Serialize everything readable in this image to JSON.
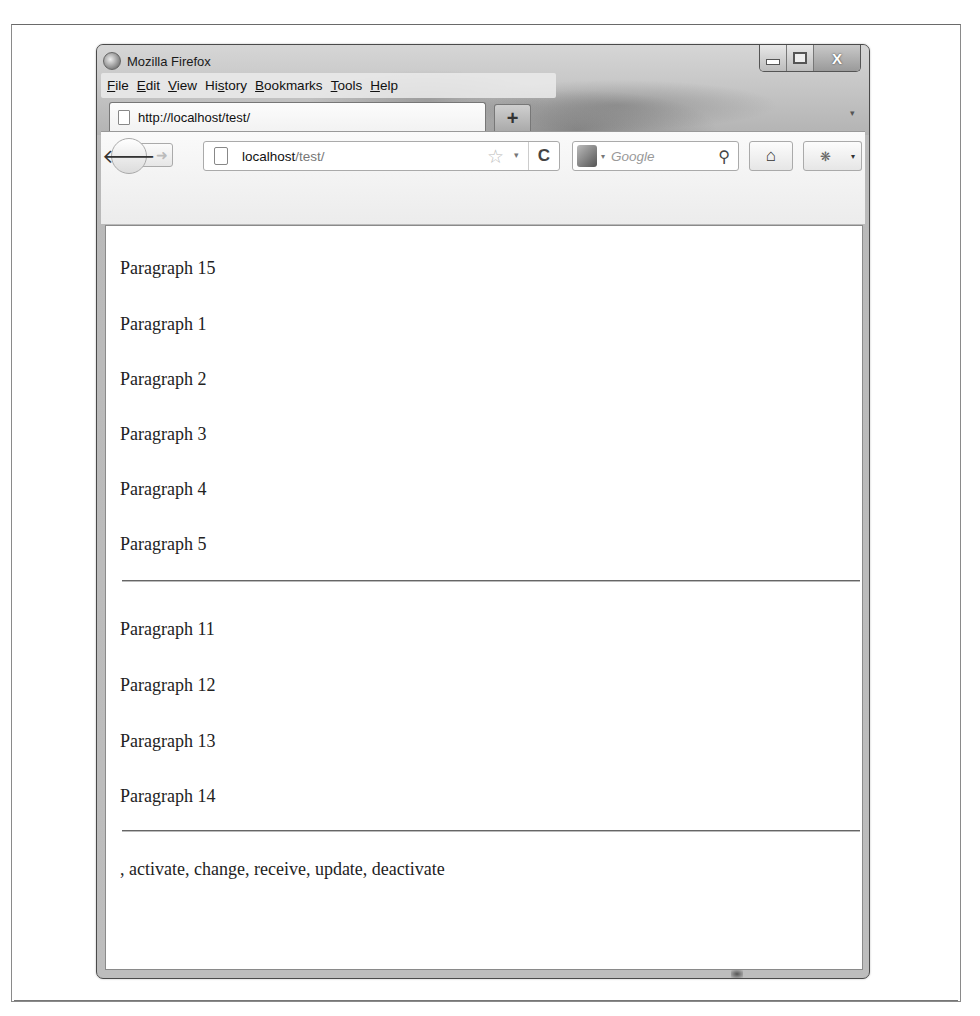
{
  "window": {
    "title": "Mozilla Firefox",
    "controls": {
      "minimize": "minimize",
      "maximize": "maximize",
      "close": "X"
    }
  },
  "menu_bar": {
    "items": [
      {
        "label": "File",
        "accesskey": "F",
        "rest": "ile"
      },
      {
        "label": "Edit",
        "accesskey": "E",
        "rest": "dit"
      },
      {
        "label": "View",
        "accesskey": "V",
        "rest": "iew"
      },
      {
        "label": "History",
        "pre": "Hi",
        "accesskey": "s",
        "rest": "tory"
      },
      {
        "label": "Bookmarks",
        "accesskey": "B",
        "rest": "ookmarks"
      },
      {
        "label": "Tools",
        "accesskey": "T",
        "rest": "ools"
      },
      {
        "label": "Help",
        "accesskey": "H",
        "rest": "elp"
      }
    ]
  },
  "tabs": [
    {
      "label": "http://localhost/test/",
      "active": true
    }
  ],
  "tab_strip": {
    "new_tab": "+",
    "tab_list_arrow": "▾"
  },
  "toolbar": {
    "back": "🡐",
    "forward": "➜",
    "url": {
      "host": "localhost",
      "path": "/test/"
    },
    "bookmark_star": "☆",
    "url_dropdown": "▾",
    "reload": "C",
    "search": {
      "engine_dropdown": "▾",
      "placeholder": "Google",
      "icon": "⚲"
    },
    "home": "⌂",
    "addon": "❋",
    "addon_dropdown": "▾"
  },
  "content": {
    "group1": [
      "Paragraph 15",
      "Paragraph 1",
      "Paragraph 2",
      "Paragraph 3",
      "Paragraph 4",
      "Paragraph 5"
    ],
    "group2": [
      "Paragraph 11",
      "Paragraph 12",
      "Paragraph 13",
      "Paragraph 14"
    ],
    "event_log": ", activate, change, receive, update, deactivate"
  }
}
